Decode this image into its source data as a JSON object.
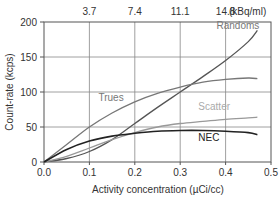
{
  "chart_data": {
    "type": "line",
    "title": "",
    "xlabel": "Activity concentration (µCi/cc)",
    "ylabel": "Count-rate (kcps)",
    "secondary_xlabel": "(kBq/ml)",
    "xlim": [
      0.0,
      0.5
    ],
    "ylim": [
      0,
      200
    ],
    "grid": true,
    "x_ticks": [
      "0.0",
      "0.1",
      "0.2",
      "0.3",
      "0.4",
      "0.5"
    ],
    "y_ticks": [
      "0",
      "50",
      "100",
      "150",
      "200"
    ],
    "top_ticks": [
      {
        "x": 0.1,
        "label": "3.7"
      },
      {
        "x": 0.2,
        "label": "7.4"
      },
      {
        "x": 0.3,
        "label": "11.1"
      },
      {
        "x": 0.4,
        "label": "14.8"
      }
    ],
    "x": [
      0.0,
      0.05,
      0.1,
      0.15,
      0.2,
      0.25,
      0.3,
      0.35,
      0.4,
      0.45,
      0.47
    ],
    "series": [
      {
        "name": "Randoms",
        "color": "#555555",
        "values": [
          0,
          5,
          15,
          32,
          55,
          78,
          100,
          122,
          145,
          172,
          188
        ]
      },
      {
        "name": "Trues",
        "color": "#777777",
        "values": [
          0,
          25,
          50,
          70,
          86,
          98,
          107,
          114,
          118,
          120,
          119
        ]
      },
      {
        "name": "Scatter",
        "color": "#999999",
        "values": [
          0,
          8,
          20,
          32,
          42,
          50,
          55,
          58,
          61,
          63,
          64
        ]
      },
      {
        "name": "NEC",
        "color": "#222222",
        "values": [
          0,
          18,
          30,
          37,
          41,
          44,
          45,
          45,
          44,
          42,
          39
        ]
      }
    ],
    "annotations": [
      {
        "text": "Randoms",
        "x": 0.38,
        "y": 190
      },
      {
        "text": "Trues",
        "x": 0.12,
        "y": 87
      },
      {
        "text": "Scatter",
        "x": 0.34,
        "y": 74
      },
      {
        "text": "NEC",
        "x": 0.34,
        "y": 30
      }
    ]
  }
}
